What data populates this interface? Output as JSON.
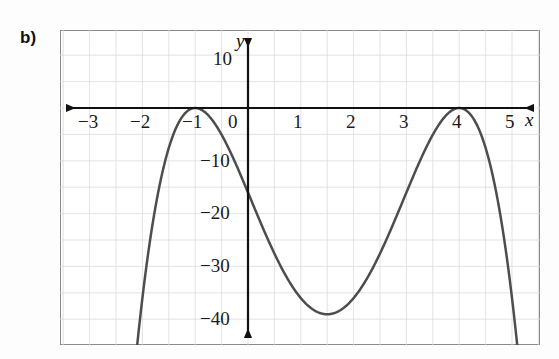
{
  "figure": {
    "part_label": "b)",
    "background_color": "#ffffff",
    "frame_color": "#8a8a8a",
    "grid_color": "#d9d9de",
    "axis_color": "#111111",
    "curve_color": "#4a4a4a"
  },
  "axes": {
    "x_axis_name": "x",
    "y_axis_name": "y",
    "x_tick_labels": [
      "−3",
      "−2",
      "−1",
      "0",
      "1",
      "2",
      "3",
      "4",
      "5"
    ],
    "y_tick_labels": [
      "10",
      "−10",
      "−20",
      "−30",
      "−40"
    ]
  },
  "chart_data": {
    "type": "line",
    "title": "",
    "xlabel": "x",
    "ylabel": "y",
    "xlim": [
      -3.55,
      5.5
    ],
    "ylim": [
      -44.7,
      14.8
    ],
    "grid": true,
    "grid_step_x": 0.5,
    "grid_step_y": 5,
    "legend": "none",
    "x_ticks": [
      -3,
      -2,
      -1,
      0,
      1,
      2,
      3,
      4,
      5
    ],
    "y_ticks": [
      10,
      -10,
      -20,
      -30,
      -40
    ],
    "annotations": [
      "x-intercept (double root) at x = -1",
      "x-intercept (double root) at x = 4",
      "y-intercept at y = -16",
      "local minimum near (1.5, -39)"
    ],
    "series": [
      {
        "name": "y = -(x+1)^2(x-4)^2",
        "x": [
          -2.1,
          -2.05,
          -2.0,
          -1.95,
          -1.9,
          -1.85,
          -1.8,
          -1.75,
          -1.7,
          -1.65,
          -1.6,
          -1.55,
          -1.5,
          -1.45,
          -1.4,
          -1.35,
          -1.3,
          -1.25,
          -1.2,
          -1.15,
          -1.1,
          -1.05,
          -1.0,
          -0.95,
          -0.9,
          -0.85,
          -0.8,
          -0.75,
          -0.7,
          -0.65,
          -0.6,
          -0.55,
          -0.5,
          -0.45,
          -0.4,
          -0.35,
          -0.3,
          -0.25,
          -0.2,
          -0.15,
          -0.1,
          -0.05,
          0.0,
          0.1,
          0.2,
          0.3,
          0.4,
          0.5,
          0.6,
          0.7,
          0.8,
          0.9,
          1.0,
          1.1,
          1.2,
          1.3,
          1.4,
          1.5,
          1.6,
          1.7,
          1.8,
          1.9,
          2.0,
          2.1,
          2.2,
          2.3,
          2.4,
          2.5,
          2.6,
          2.7,
          2.8,
          2.9,
          3.0,
          3.1,
          3.2,
          3.3,
          3.4,
          3.5,
          3.6,
          3.7,
          3.8,
          3.9,
          4.0,
          4.1,
          4.2,
          4.3,
          4.4,
          4.5,
          4.6,
          4.7,
          4.8,
          4.9,
          5.0,
          5.1
        ],
        "y": [
          -45.0,
          -40.2,
          -36.0,
          -32.1,
          -28.4,
          -25.1,
          -22.0,
          -19.1,
          -16.6,
          -14.3,
          -12.2,
          -10.3,
          -8.7,
          -7.2,
          -5.9,
          -4.8,
          -3.8,
          -3.0,
          -2.3,
          -1.7,
          -1.2,
          -0.8,
          0.0,
          -0.6,
          -1.2,
          -2.0,
          -3.0,
          -4.1,
          -5.4,
          -6.9,
          -8.5,
          -10.2,
          -12.1,
          -14.1,
          -16.2,
          -18.4,
          -20.7,
          -23.0,
          -25.4,
          -27.8,
          -30.2,
          -32.6,
          -16.0,
          -18.7,
          -21.2,
          -23.7,
          -26.1,
          -28.3,
          -30.2,
          -32.0,
          -33.5,
          -34.8,
          -35.9,
          -36.8,
          -37.6,
          -38.2,
          -38.6,
          -38.8,
          -38.9,
          -38.8,
          -38.6,
          -38.2,
          -37.6,
          -36.8,
          -35.9,
          -34.8,
          -33.5,
          -32.0,
          -30.2,
          -28.3,
          -26.1,
          -23.7,
          -21.2,
          -18.7,
          -16.2,
          -13.7,
          -11.2,
          -8.8,
          -6.6,
          -4.5,
          -2.7,
          -1.2,
          0.0,
          -1.2,
          -2.7,
          -4.5,
          -6.6,
          -8.8,
          -11.2,
          -13.7,
          -16.2,
          -18.7,
          -21.2,
          -23.7
        ]
      }
    ]
  },
  "layout": {
    "x_label_positions": [
      88,
      140,
      192,
      236,
      298,
      351,
      403,
      456,
      508
    ],
    "y_label_positions": [
      58,
      160,
      212,
      265,
      318
    ],
    "y_axis_x": 248,
    "x_axis_y": 108,
    "px_per_unit_x": 52.8,
    "px_per_unit_y": 5.28
  }
}
